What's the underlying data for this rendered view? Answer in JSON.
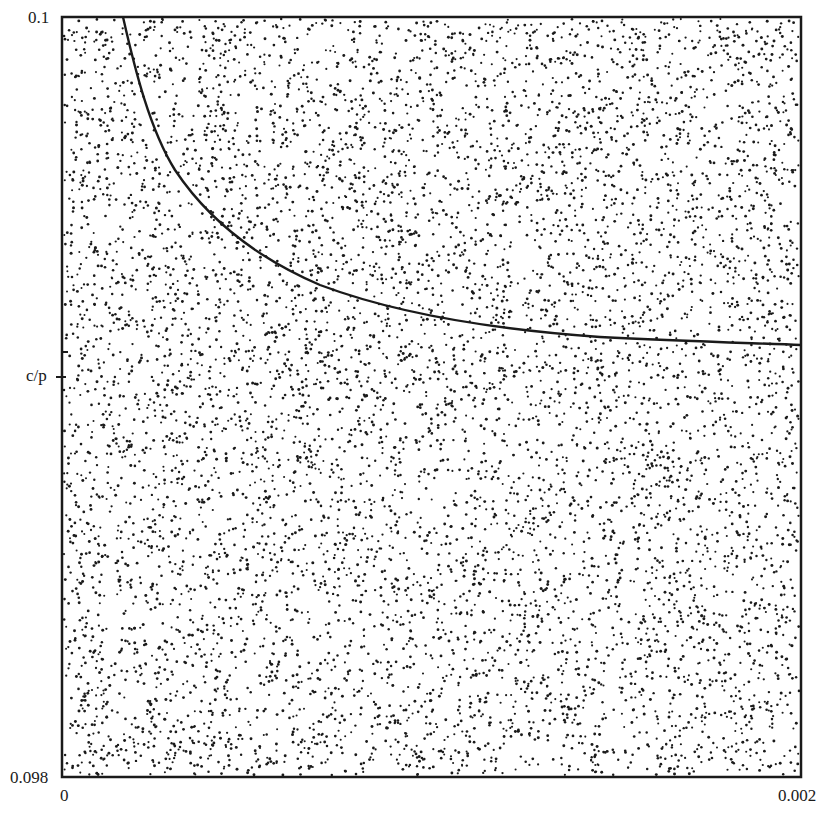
{
  "chart_data": {
    "type": "scatter",
    "title": "",
    "xlabel": "",
    "ylabel": "",
    "xlim": [
      0,
      0.002
    ],
    "ylim": [
      0.098,
      0.1
    ],
    "x_tick_labels": [
      "0",
      "0.002"
    ],
    "y_tick_labels": [
      "0.098",
      "c/p",
      "0.1"
    ],
    "y_marked_value_label": "c/p",
    "grid": false,
    "legend": null,
    "series": [
      {
        "name": "random points",
        "kind": "scatter",
        "approx_count": 8000,
        "distribution": "uniform over plot area",
        "color": "#1a1a1a"
      },
      {
        "name": "curve",
        "kind": "line",
        "color": "#1a1a1a",
        "x": [
          0.000164,
          0.000219,
          0.000278,
          0.000351,
          0.000373,
          0.000456,
          0.00064,
          0.00091,
          0.001181,
          0.001452,
          0.001722,
          0.002
        ],
        "y": [
          0.1,
          0.09978,
          0.09965,
          0.09952,
          0.09948,
          0.09943,
          0.09936,
          0.09927,
          0.09923,
          0.09921,
          0.0992,
          0.09912
        ]
      }
    ]
  },
  "labels": {
    "y_top": "0.1",
    "y_mid": "c/p",
    "y_bottom": "0.098",
    "x_left": "0",
    "x_right": "0.002"
  }
}
